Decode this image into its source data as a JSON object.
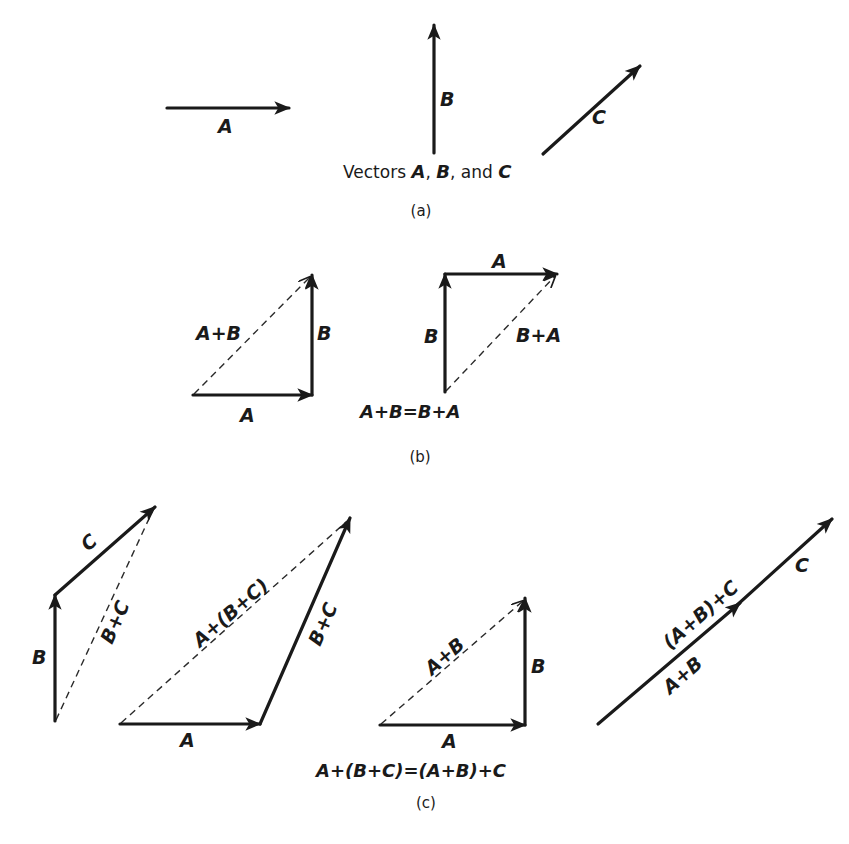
{
  "figure": {
    "panel_a": {
      "vector_labels": {
        "a": "A",
        "b": "B",
        "c": "C"
      },
      "caption_prefix": "Vectors ",
      "caption_a": "A",
      "caption_sep1": ", ",
      "caption_b": "B",
      "caption_sep2": ", and ",
      "caption_c": "C",
      "panel_label": "(a)"
    },
    "panel_b": {
      "left": {
        "a": "A",
        "b": "B",
        "sum": "A+B"
      },
      "right": {
        "a": "A",
        "b": "B",
        "sum": "B+A"
      },
      "equation": "A+B=B+A",
      "panel_label": "(b)"
    },
    "panel_c": {
      "diagram1": {
        "b": "B",
        "c": "C",
        "sum": "B+C"
      },
      "diagram2": {
        "a": "A",
        "bc": "B+C",
        "sum": "A+(B+C)"
      },
      "diagram3": {
        "a": "A",
        "b": "B",
        "sum": "A+B"
      },
      "diagram4": {
        "ab": "A+B",
        "c": "C",
        "sum": "(A+B)+C"
      },
      "equation": "A+(B+C)=(A+B)+C",
      "panel_label": "(c)"
    }
  }
}
